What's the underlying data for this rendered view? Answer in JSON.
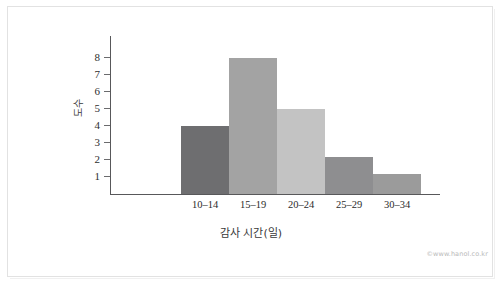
{
  "chart_data": {
    "type": "bar",
    "title": "",
    "subtitle": "",
    "categories": [
      "10–14",
      "15–19",
      "20–24",
      "25–29",
      "30–34"
    ],
    "values": [
      4,
      8,
      5,
      2.2,
      1.2
    ],
    "xlabel": "감사 시간(일)",
    "ylabel": "도수",
    "ylim": [
      0,
      8.6
    ],
    "yticks": [
      1,
      2,
      3,
      4,
      5,
      6,
      7,
      8
    ],
    "ytick_labels": [
      "1",
      "2",
      "3",
      "4",
      "5",
      "6",
      "7",
      "8"
    ],
    "grid": false,
    "legend": "none",
    "bar_colors": [
      "#6e6e70",
      "#a3a3a3",
      "#c3c3c3",
      "#8e8e90",
      "#9b9b9b"
    ],
    "axis_color": "#58585a",
    "background": "#ffffff"
  },
  "footer": {
    "watermark": "©www.hanol.co.kr"
  }
}
